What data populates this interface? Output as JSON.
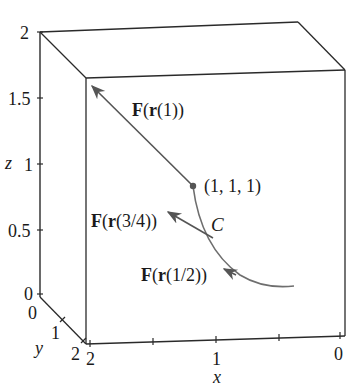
{
  "caption": "three points on C.",
  "z_axis": {
    "name": "z",
    "ticks": [
      "2",
      "1.5",
      "1",
      "0.5",
      "0"
    ]
  },
  "y_axis": {
    "name": "y",
    "ticks": [
      "0",
      "1",
      "2"
    ]
  },
  "x_axis": {
    "name": "x",
    "ticks": [
      "2",
      "1",
      "0"
    ]
  },
  "labels": {
    "point": "(1, 1, 1)",
    "curve": "C",
    "f1_bold": "F",
    "f1_r": "r",
    "f1_arg": "(1)",
    "f34_bold": "F",
    "f34_r": "r",
    "f34_arg": "(3/4)",
    "f12_bold": "F",
    "f12_r": "r",
    "f12_arg": "(1/2)"
  },
  "colors": {
    "box": "#2a2a2a",
    "curve": "#6e6e6e",
    "vectors": "#555555"
  }
}
